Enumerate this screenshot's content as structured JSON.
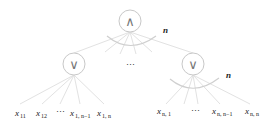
{
  "diagram": {
    "root": {
      "symbol": "∧",
      "fanout_label": "n"
    },
    "middle_ellipsis": "⋯",
    "left_child": {
      "symbol": "∨",
      "leaves": [
        {
          "base": "x",
          "sub": "11"
        },
        {
          "base": "x",
          "sub": "12"
        },
        {
          "ellipsis": "⋯"
        },
        {
          "base": "x",
          "sub": "1, n−1"
        },
        {
          "base": "x",
          "sub": "1, n"
        }
      ]
    },
    "right_child": {
      "symbol": "∨",
      "fanout_label": "n",
      "leaves": [
        {
          "base": "x",
          "sub": "n, 1"
        },
        {
          "ellipsis": "⋯"
        },
        {
          "base": "x",
          "sub": "n, n−1"
        },
        {
          "base": "x",
          "sub": "n, n"
        }
      ]
    }
  }
}
